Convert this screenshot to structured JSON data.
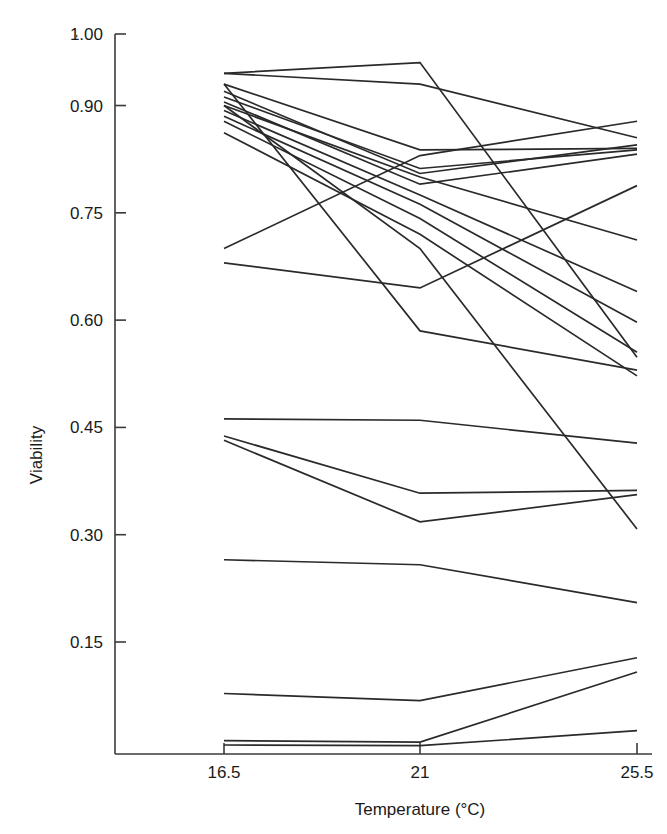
{
  "chart_data": {
    "type": "line",
    "title": "",
    "xlabel": "Temperature (°C)",
    "ylabel": "Viability",
    "categories": [
      "16.5",
      "21",
      "25.5"
    ],
    "x": [
      16.5,
      21,
      25.5
    ],
    "xlim": [
      15.6,
      26.4
    ],
    "ylim": [
      0.0,
      1.0
    ],
    "xticks": [
      "16.5",
      "21",
      "25.5"
    ],
    "yticks": [
      "1.00",
      "0.90",
      "0.75",
      "0.60",
      "0.45",
      "0.30",
      "0.15"
    ],
    "ytick_values": [
      1.0,
      0.9,
      0.75,
      0.6,
      0.45,
      0.3,
      0.15
    ],
    "grid": false,
    "legend": "none",
    "marker": "none",
    "series": [
      {
        "name": "line-01",
        "values": [
          0.945,
          0.96,
          0.548
        ]
      },
      {
        "name": "line-02",
        "values": [
          0.945,
          0.93,
          0.855
        ]
      },
      {
        "name": "line-03",
        "values": [
          0.93,
          0.838,
          0.84
        ]
      },
      {
        "name": "line-04",
        "values": [
          0.92,
          0.805,
          0.845
        ]
      },
      {
        "name": "line-05",
        "values": [
          0.912,
          0.812,
          0.838
        ]
      },
      {
        "name": "line-06",
        "values": [
          0.905,
          0.79,
          0.832
        ]
      },
      {
        "name": "line-07",
        "values": [
          0.9,
          0.8,
          0.712
        ]
      },
      {
        "name": "line-08",
        "values": [
          0.893,
          0.775,
          0.64
        ]
      },
      {
        "name": "line-09",
        "values": [
          0.885,
          0.762,
          0.597
        ]
      },
      {
        "name": "line-10",
        "values": [
          0.878,
          0.742,
          0.555
        ]
      },
      {
        "name": "line-11",
        "values": [
          0.862,
          0.72,
          0.522
        ]
      },
      {
        "name": "line-12",
        "values": [
          0.9,
          0.7,
          0.308
        ]
      },
      {
        "name": "line-13",
        "values": [
          0.93,
          0.585,
          0.53
        ]
      },
      {
        "name": "line-14",
        "values": [
          0.7,
          0.83,
          0.878
        ]
      },
      {
        "name": "line-15",
        "values": [
          0.68,
          0.645,
          0.788
        ]
      },
      {
        "name": "line-16",
        "values": [
          0.462,
          0.46,
          0.428
        ]
      },
      {
        "name": "line-17",
        "values": [
          0.438,
          0.358,
          0.362
        ]
      },
      {
        "name": "line-18",
        "values": [
          0.432,
          0.318,
          0.356
        ]
      },
      {
        "name": "line-19",
        "values": [
          0.265,
          0.258,
          0.205
        ]
      },
      {
        "name": "line-20",
        "values": [
          0.078,
          0.068,
          0.128
        ]
      },
      {
        "name": "line-21",
        "values": [
          0.012,
          0.01,
          0.108
        ]
      },
      {
        "name": "line-22",
        "values": [
          0.006,
          0.005,
          0.026
        ]
      }
    ]
  },
  "axes": {
    "x_axis_title": "Temperature (°C)",
    "y_axis_title": "Viability"
  }
}
